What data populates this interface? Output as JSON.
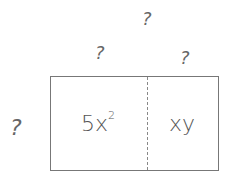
{
  "diagram": {
    "type": "area-model-rectangle",
    "labels": {
      "total_width": "?",
      "left_width": "?",
      "right_width": "?",
      "height": "?"
    },
    "cells": [
      {
        "base": "5x",
        "exponent": "2"
      },
      {
        "base": "xy",
        "exponent": ""
      }
    ]
  }
}
